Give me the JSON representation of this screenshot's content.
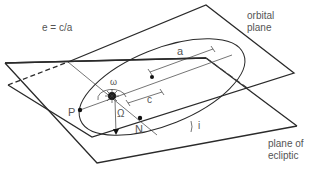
{
  "diagram": {
    "labels": {
      "eccentricity_formula": "e = c/a",
      "orbital_plane_line1": "orbital",
      "orbital_plane_line2": "plane",
      "ecliptic_plane_line1": "plane of",
      "ecliptic_plane_line2": "ecliptic",
      "semi_major_axis": "a",
      "focal_distance": "c",
      "argument_of_periapsis": "ω",
      "longitude_ascending_node": "Ω",
      "inclination": "i",
      "periapsis": "P",
      "ascending_node": "N"
    },
    "colors": {
      "line": "#2a2a2a",
      "text": "#555555",
      "background": "#ffffff"
    }
  }
}
